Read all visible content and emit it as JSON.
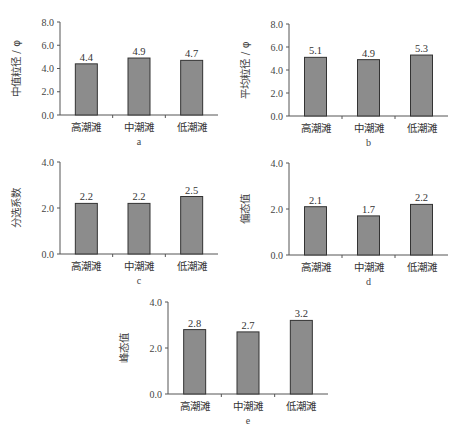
{
  "chart_data": [
    {
      "id": "a",
      "type": "bar",
      "title": "",
      "sublabel": "a",
      "xlabel": "",
      "ylabel": "中值粒径 / φ",
      "categories": [
        "高潮滩",
        "中潮滩",
        "低潮滩"
      ],
      "values": [
        4.4,
        4.9,
        4.7
      ],
      "value_labels": [
        "4.4",
        "4.9",
        "4.7"
      ],
      "ylim": [
        0,
        8
      ],
      "yticks": [
        "0.0",
        "2.0",
        "4.0",
        "6.0",
        "8.0"
      ],
      "grid": false,
      "bar_color": "#8c8c8c"
    },
    {
      "id": "b",
      "type": "bar",
      "title": "",
      "sublabel": "b",
      "xlabel": "",
      "ylabel": "平均粒径 / φ",
      "categories": [
        "高潮滩",
        "中潮滩",
        "低潮滩"
      ],
      "values": [
        5.1,
        4.9,
        5.3
      ],
      "value_labels": [
        "5.1",
        "4.9",
        "5.3"
      ],
      "ylim": [
        0,
        8
      ],
      "yticks": [
        "0.0",
        "2.0",
        "4.0",
        "6.0",
        "8.0"
      ],
      "grid": false,
      "bar_color": "#8c8c8c"
    },
    {
      "id": "c",
      "type": "bar",
      "title": "",
      "sublabel": "c",
      "xlabel": "",
      "ylabel": "分选系数",
      "categories": [
        "高潮滩",
        "中潮滩",
        "低潮滩"
      ],
      "values": [
        2.2,
        2.2,
        2.5
      ],
      "value_labels": [
        "2.2",
        "2.2",
        "2.5"
      ],
      "ylim": [
        0,
        4
      ],
      "yticks": [
        "0.0",
        "2.0",
        "4.0"
      ],
      "grid": false,
      "bar_color": "#8c8c8c"
    },
    {
      "id": "d",
      "type": "bar",
      "title": "",
      "sublabel": "d",
      "xlabel": "",
      "ylabel": "偏态值",
      "categories": [
        "高潮滩",
        "中潮滩",
        "低潮滩"
      ],
      "values": [
        2.1,
        1.7,
        2.2
      ],
      "value_labels": [
        "2.1",
        "1.7",
        "2.2"
      ],
      "ylim": [
        0,
        4
      ],
      "yticks": [
        "0.0",
        "2.0",
        "4.0"
      ],
      "grid": false,
      "bar_color": "#8c8c8c"
    },
    {
      "id": "e",
      "type": "bar",
      "title": "",
      "sublabel": "e",
      "xlabel": "",
      "ylabel": "峰态值",
      "categories": [
        "高潮滩",
        "中潮滩",
        "低潮滩"
      ],
      "values": [
        2.8,
        2.7,
        3.2
      ],
      "value_labels": [
        "2.8",
        "2.7",
        "3.2"
      ],
      "ylim": [
        0,
        4
      ],
      "yticks": [
        "0.0",
        "2.0",
        "4.0"
      ],
      "grid": false,
      "bar_color": "#8c8c8c"
    }
  ]
}
